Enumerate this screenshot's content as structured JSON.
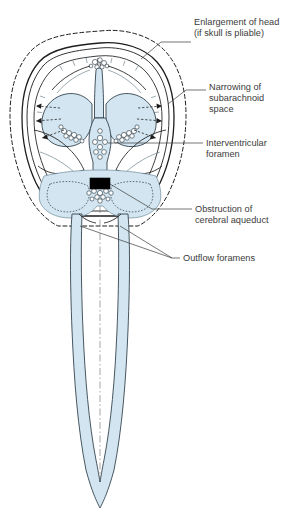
{
  "figure": {
    "background_color": "#ffffff",
    "csf_color": "#d2e5f0",
    "outline_color": "#1d1d1d",
    "text_color": "#3b3b3b",
    "obstruction_color": "#000000"
  },
  "labels": {
    "enlargement": {
      "line1": "Enlargement of head",
      "line2": "(if skull is pliable)"
    },
    "narrowing": {
      "line1": "Narrowing of",
      "line2": "subarachnoid",
      "line3": "space"
    },
    "interventricular": {
      "line1": "Interventricular",
      "line2": "foramen"
    },
    "obstruction": {
      "line1": "Obstruction of",
      "line2": "cerebral aqueduct"
    },
    "outflow": {
      "line1": "Outflow foramens"
    }
  }
}
